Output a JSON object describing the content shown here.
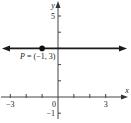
{
  "chart_data": {
    "type": "line",
    "title": "",
    "xlabel": "x",
    "ylabel": "y",
    "xlim": [
      -3.6,
      4.3
    ],
    "ylim": [
      -1.3,
      6.0
    ],
    "x_ticks": [
      -3,
      -2,
      -1,
      0,
      1,
      2,
      3
    ],
    "y_ticks": [
      -1,
      1,
      2,
      3,
      4,
      5
    ],
    "x_tick_labels": [
      {
        "value": -3,
        "label": "-3"
      },
      {
        "value": 0,
        "label": "0"
      },
      {
        "value": 3,
        "label": "3"
      }
    ],
    "y_tick_labels": [
      {
        "value": 5,
        "label": "5"
      },
      {
        "value": -1,
        "label": "-1"
      }
    ],
    "grid": false,
    "series": [
      {
        "name": "horizontal line y = 3",
        "kind": "line",
        "y": 3,
        "arrows": "both",
        "color": "#1a1a1a"
      }
    ],
    "points": [
      {
        "name": "P",
        "x": -1,
        "y": 3,
        "label": "P = (-1, 3)",
        "color": "#111111"
      }
    ]
  }
}
